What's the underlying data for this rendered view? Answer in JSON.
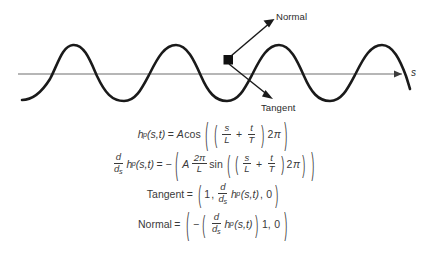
{
  "figure": {
    "name": "sine-wave-with-tangent-and-normal",
    "axis_label": "s",
    "normal_label": "Normal",
    "tangent_label": "Tangent",
    "colors": {
      "curve": "#1a1a1a",
      "axis": "#6e6e6e",
      "text": "#2b2b2b",
      "background": "#ffffff"
    },
    "wave": {
      "axis_y": 74,
      "peak_y": 44,
      "trough_y": 101,
      "amplitude_px": 29,
      "period_px": 136,
      "x_start": 22,
      "x_end": 410,
      "cycles": 2.85
    },
    "point": {
      "x": 228,
      "y": 60
    },
    "normal_arrow": {
      "from_x": 230,
      "from_y": 57,
      "to_x": 273,
      "to_y": 20
    },
    "tangent_arrow": {
      "from_x": 229,
      "from_y": 64,
      "to_x": 272,
      "to_y": 97
    }
  },
  "equations": {
    "eq1": {
      "lhs_fn": "h",
      "lhs_sub": "p",
      "lhs_args": "(s,t)",
      "equals": "=",
      "amplitude": "A",
      "trig": "cos",
      "num1": "s",
      "den1": "L",
      "plus": "+",
      "num2": "t",
      "den2": "T",
      "factor": "2",
      "pi": "π"
    },
    "eq2": {
      "d_num": "d",
      "d_den": "d",
      "d_den_sub": "s",
      "lhs_fn": "h",
      "lhs_sub": "p",
      "lhs_args": "(s,t)",
      "equals": "=",
      "minus": "−",
      "amplitude": "A",
      "coef_num": "2π",
      "coef_den": "L",
      "trig": "sin",
      "num1": "s",
      "den1": "L",
      "plus": "+",
      "num2": "t",
      "den2": "T",
      "factor": "2",
      "pi": "π"
    },
    "eq3": {
      "label": "Tangent",
      "equals": "=",
      "first": "1",
      "comma1": ",",
      "d_num": "d",
      "d_den": "d",
      "d_den_sub": "s",
      "fn": "h",
      "fn_sub": "p",
      "fn_args": "(s,t)",
      "comma2": ",",
      "last": "0"
    },
    "eq4": {
      "label": "Normal",
      "equals": "=",
      "minus": "−",
      "d_num": "d",
      "d_den": "d",
      "d_den_sub": "s",
      "fn": "h",
      "fn_sub": "p",
      "fn_args": "(s,t)",
      "comma1": "1,",
      "last": "0"
    }
  }
}
